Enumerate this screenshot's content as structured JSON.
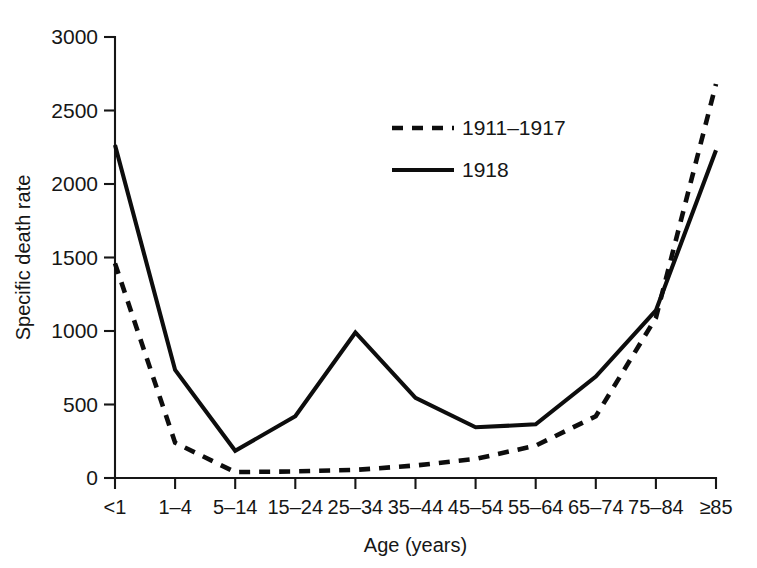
{
  "chart_data": {
    "type": "line",
    "title": "",
    "xlabel": "Age (years)",
    "ylabel": "Specific death rate",
    "categories": [
      "<1",
      "1–4",
      "5–14",
      "15–24",
      "25–34",
      "35–44",
      "45–54",
      "55–64",
      "65–74",
      "75–84",
      "≥85"
    ],
    "ylim": [
      0,
      3000
    ],
    "yticks": [
      0,
      500,
      1000,
      1500,
      2000,
      2500,
      3000
    ],
    "ytick_labels": [
      "0",
      "500",
      "1000",
      "1500",
      "2000",
      "2500",
      "3000"
    ],
    "grid": false,
    "legend_position": "upper-center",
    "series": [
      {
        "name": "1911–1917",
        "style": "dashed",
        "color": "#0d0d0d",
        "values": [
          1460,
          240,
          40,
          45,
          55,
          85,
          130,
          220,
          420,
          1090,
          2680
        ]
      },
      {
        "name": "1918",
        "style": "solid",
        "color": "#0d0d0d",
        "values": [
          2265,
          735,
          185,
          420,
          990,
          545,
          345,
          365,
          690,
          1140,
          2230
        ]
      }
    ]
  },
  "legend": {
    "entries": [
      {
        "label": "1911–1917"
      },
      {
        "label": "1918"
      }
    ]
  },
  "axes": {
    "y_title": "Specific death rate",
    "x_title": "Age (years)"
  }
}
